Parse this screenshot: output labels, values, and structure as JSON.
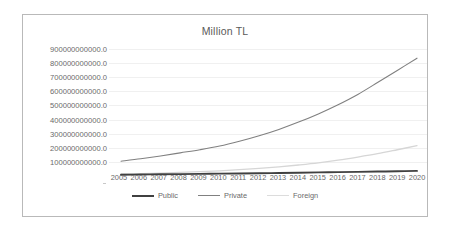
{
  "chart_data": {
    "type": "line",
    "title": "Million TL",
    "xlabel": "",
    "ylabel": "",
    "grid": true,
    "legend_position": "bottom",
    "x": [
      2005,
      2006,
      2007,
      2008,
      2009,
      2010,
      2011,
      2012,
      2013,
      2014,
      2015,
      2016,
      2017,
      2018,
      2019,
      2020
    ],
    "categories": [
      "2005",
      "2006",
      "2007",
      "2008",
      "2009",
      "2010",
      "2011",
      "2012",
      "2013",
      "2014",
      "2015",
      "2016",
      "2017",
      "2018",
      "2019",
      "2020"
    ],
    "ylim": [
      0,
      900000000000
    ],
    "yticks": [
      100000000000,
      200000000000,
      300000000000,
      400000000000,
      500000000000,
      600000000000,
      700000000000,
      800000000000,
      900000000000
    ],
    "ytick_labels": [
      "900000000000.0",
      "800000000000.0",
      "700000000000.0",
      "600000000000.0",
      "500000000000.0",
      "400000000000.0",
      "300000000000.0",
      "200000000000.0",
      "100000000000.0"
    ],
    "series": [
      {
        "name": "Public",
        "color": "#404040",
        "width": 1.9,
        "values": [
          9000000000,
          10500000000,
          12000000000,
          13500000000,
          15000000000,
          16500000000,
          18000000000,
          19500000000,
          21500000000,
          23500000000,
          25500000000,
          27500000000,
          29500000000,
          31500000000,
          33500000000,
          36000000000
        ]
      },
      {
        "name": "Private",
        "color": "#808080",
        "width": 1.1,
        "values": [
          105000000000,
          122000000000,
          142000000000,
          164000000000,
          186000000000,
          212000000000,
          246000000000,
          285000000000,
          330000000000,
          382000000000,
          440000000000,
          505000000000,
          578000000000,
          662000000000,
          748000000000,
          835000000000
        ]
      },
      {
        "name": "Foreign",
        "color": "#d6d6d6",
        "width": 1.3,
        "values": [
          14000000000,
          17000000000,
          21000000000,
          26000000000,
          31000000000,
          37000000000,
          45000000000,
          54000000000,
          65000000000,
          78000000000,
          93000000000,
          112000000000,
          134000000000,
          158000000000,
          186000000000,
          215000000000
        ]
      }
    ]
  },
  "legend": {
    "items": [
      {
        "label": "Public",
        "color": "#404040",
        "width": 2.6
      },
      {
        "label": "Private",
        "color": "#808080",
        "width": 1.4
      },
      {
        "label": "Foreign",
        "color": "#dcdcdc",
        "width": 1.6
      }
    ]
  },
  "colors": {
    "frame_border": "#b9b9b9",
    "gridline": "#f0f0f0",
    "tick_text": "#6a6a6a",
    "title_text": "#5a5a5a",
    "background": "#ffffff"
  }
}
